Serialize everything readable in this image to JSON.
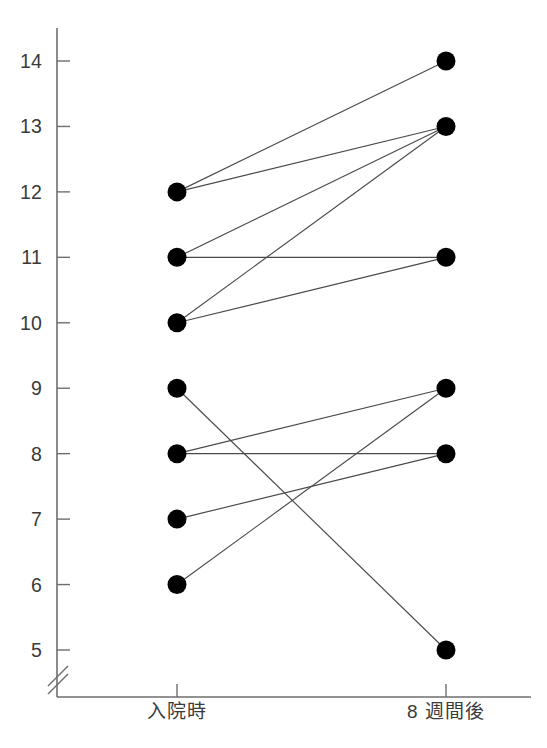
{
  "chart_data": {
    "type": "line",
    "title": "",
    "subtitle": "",
    "xlabel": "",
    "ylabel": "",
    "categories": [
      "入院時",
      "8 週間後"
    ],
    "x_tick_labels": [
      "入院時",
      "8 週間後"
    ],
    "y_tick_labels": [
      "5",
      "6",
      "7",
      "8",
      "9",
      "10",
      "11",
      "12",
      "13",
      "14"
    ],
    "y_ticks": [
      5,
      6,
      7,
      8,
      9,
      10,
      11,
      12,
      13,
      14
    ],
    "ylim": [
      4.6,
      14.6
    ],
    "grid": false,
    "legend": "none",
    "axis_break": true,
    "axis_break_note": "double-slash break on y-axis below 5",
    "marker": "filled-circle",
    "series": [
      {
        "name": "subject-1",
        "values": [
          12,
          14
        ]
      },
      {
        "name": "subject-2",
        "values": [
          12,
          13
        ]
      },
      {
        "name": "subject-3",
        "values": [
          11,
          13
        ]
      },
      {
        "name": "subject-4",
        "values": [
          11,
          11
        ]
      },
      {
        "name": "subject-5",
        "values": [
          10,
          13
        ]
      },
      {
        "name": "subject-6",
        "values": [
          10,
          11
        ]
      },
      {
        "name": "subject-7",
        "values": [
          9,
          5
        ]
      },
      {
        "name": "subject-8",
        "values": [
          8,
          9
        ]
      },
      {
        "name": "subject-9",
        "values": [
          8,
          8
        ]
      },
      {
        "name": "subject-10",
        "values": [
          7,
          8
        ]
      },
      {
        "name": "subject-11",
        "values": [
          6,
          9
        ]
      }
    ],
    "left_points": [
      12,
      11,
      10,
      9,
      8,
      7,
      6
    ],
    "right_points": [
      14,
      13,
      11,
      9,
      8,
      5
    ]
  },
  "caption": {
    "text": ""
  },
  "colors": {
    "marker": "#000000",
    "line": "#4a4a4a",
    "axis": "#6e6e6e",
    "text": "#3a3a3a",
    "background": "#ffffff"
  }
}
